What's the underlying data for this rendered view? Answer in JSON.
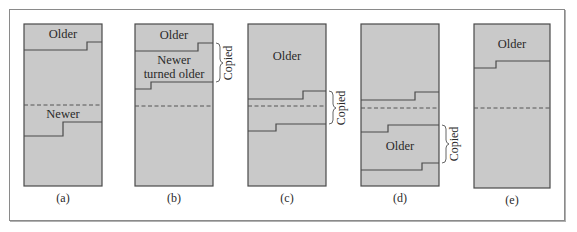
{
  "diagram": {
    "colors": {
      "fill": "#c9c9c9",
      "stroke": "#4a4a4a",
      "frame": "#8a8a8a"
    },
    "panels": [
      {
        "id": "a",
        "caption": "(a)",
        "labels": [
          {
            "text": "Older"
          },
          {
            "text": "Newer"
          }
        ]
      },
      {
        "id": "b",
        "caption": "(b)",
        "labels": [
          {
            "text": "Older"
          },
          {
            "text": "Newer"
          },
          {
            "text": "turned older"
          }
        ],
        "bracket_label": "Copied"
      },
      {
        "id": "c",
        "caption": "(c)",
        "labels": [
          {
            "text": "Older"
          }
        ],
        "bracket_label": "Copied"
      },
      {
        "id": "d",
        "caption": "(d)",
        "labels": [
          {
            "text": "Older"
          }
        ],
        "bracket_label": "Copied"
      },
      {
        "id": "e",
        "caption": "(e)",
        "labels": [
          {
            "text": "Older"
          }
        ]
      }
    ]
  }
}
